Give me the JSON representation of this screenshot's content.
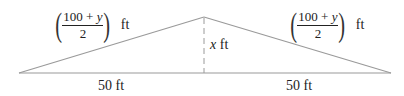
{
  "diagram": {
    "type": "isosceles-triangle",
    "vertices": {
      "left": [
        19,
        73
      ],
      "apex": [
        204,
        17
      ],
      "right": [
        391,
        73
      ]
    },
    "colors": {
      "line": "#9a9a9a",
      "altitude": "#9a9a9a",
      "text": "#222222"
    },
    "labels": {
      "left_side": {
        "numerator": "100 + y",
        "numerator_const": "100 + ",
        "numerator_var": "y",
        "denominator": "2",
        "unit": "ft"
      },
      "right_side": {
        "numerator": "100 + y",
        "numerator_const": "100 + ",
        "numerator_var": "y",
        "denominator": "2",
        "unit": "ft"
      },
      "height": {
        "var": "x",
        "unit": " ft"
      },
      "left_base": "50 ft",
      "right_base": "50 ft"
    }
  }
}
